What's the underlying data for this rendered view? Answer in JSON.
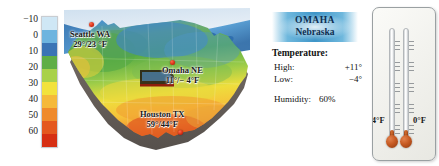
{
  "legend": {
    "title": "temperature-scale",
    "unit": "°F",
    "ticks": [
      "−10",
      "0",
      "10",
      "20",
      "30",
      "40",
      "50",
      "60"
    ],
    "colors": [
      "#cfe7f5",
      "#6db4df",
      "#3a74b5",
      "#5fae46",
      "#a8d14a",
      "#f2e23c",
      "#f5b93a",
      "#ef8a2c",
      "#e4581f",
      "#d62f13"
    ]
  },
  "map": {
    "name": "united-states-temperature-map",
    "cities": [
      {
        "id": "seattle",
        "name": "Seattle WA",
        "temps": "29°/23 °F",
        "label_left": 18,
        "label_top": 24,
        "dot_left": 27,
        "dot_top": 18
      },
      {
        "id": "omaha",
        "name": "Omaha NE",
        "temps": "11°/− 4°F",
        "label_left": 110,
        "label_top": 58,
        "dot_left": 110,
        "dot_top": 54
      },
      {
        "id": "houston",
        "name": "Houston TX",
        "temps": "59°/44°F",
        "label_left": 78,
        "label_top": 100,
        "dot_left": 116,
        "dot_top": 123
      }
    ]
  },
  "omaha_panel": {
    "city": "OMAHA",
    "state": "Nebraska",
    "temperature_heading": "Temperature:",
    "high_label": "High:",
    "high_value": "+11°",
    "low_label": "Low:",
    "low_value": "−4°",
    "humidity_label": "Humidity:",
    "humidity_value": "60%"
  },
  "thermometers": [
    {
      "id": "low-thermometer",
      "label": "−4°F"
    },
    {
      "id": "high-thermometer",
      "label": "0°F"
    }
  ]
}
